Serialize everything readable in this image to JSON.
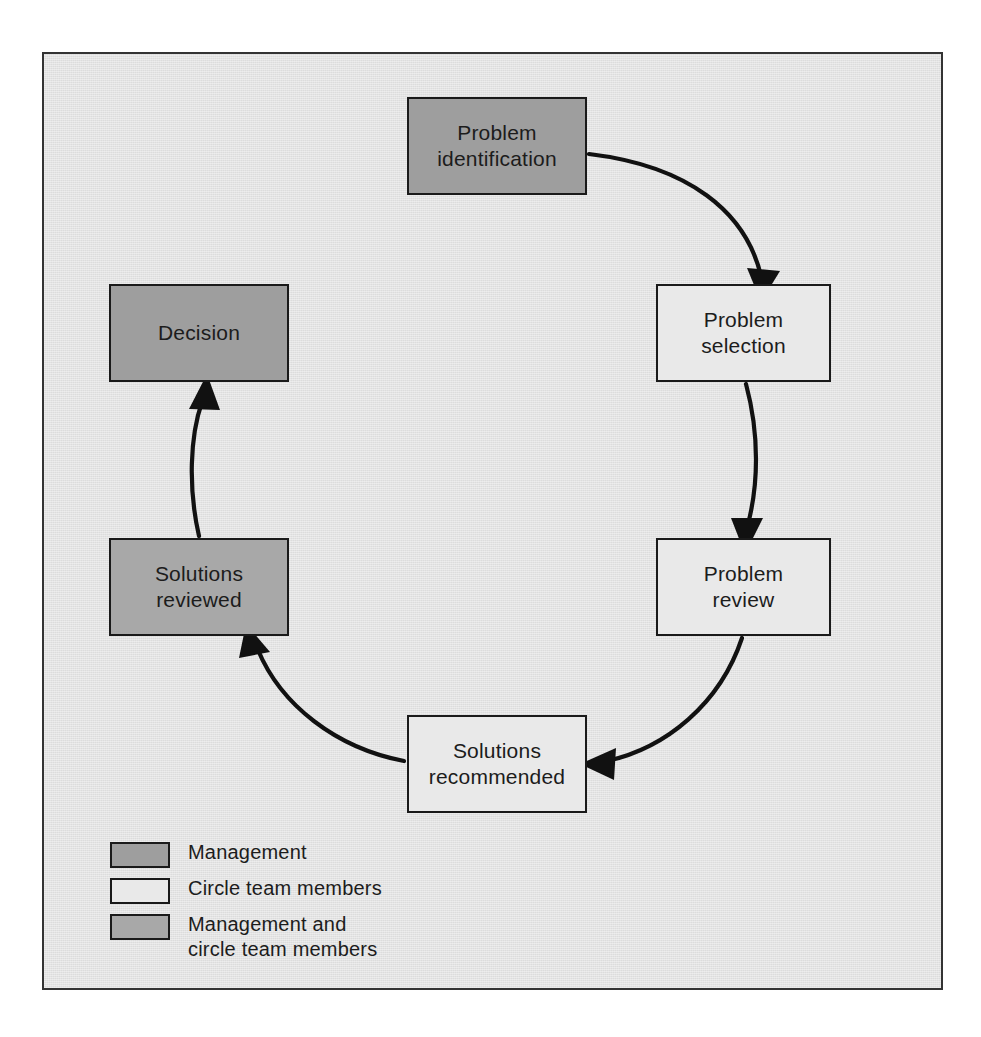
{
  "figure": {
    "frame_border_color": "#333333",
    "background_color": "#e3e3e3"
  },
  "palette": {
    "management": "#9e9e9e",
    "circle_team_members": "#e9e9e9",
    "management_and_circle_team_members": "#a8a8a8",
    "outline": "#1a1a1a",
    "arrow": "#111111",
    "text": "#1c1c1c"
  },
  "nodes": [
    {
      "id": "problem-identification",
      "label": "Problem\nidentification",
      "category": "management",
      "x": 363,
      "y": 43,
      "w": 180,
      "h": 98
    },
    {
      "id": "problem-selection",
      "label": "Problem\nselection",
      "category": "circle_team_members",
      "x": 612,
      "y": 230,
      "w": 175,
      "h": 98
    },
    {
      "id": "problem-review",
      "label": "Problem\nreview",
      "category": "circle_team_members",
      "x": 612,
      "y": 484,
      "w": 175,
      "h": 98
    },
    {
      "id": "solutions-recommended",
      "label": "Solutions\nrecommended",
      "category": "circle_team_members",
      "x": 363,
      "y": 661,
      "w": 180,
      "h": 98
    },
    {
      "id": "solutions-reviewed",
      "label": "Solutions\nreviewed",
      "category": "management_and_circle_team_members",
      "x": 65,
      "y": 484,
      "w": 180,
      "h": 98
    },
    {
      "id": "decision",
      "label": "Decision",
      "category": "management",
      "x": 65,
      "y": 230,
      "w": 180,
      "h": 98
    }
  ],
  "edges": [
    {
      "id": "edge-identification-to-selection",
      "from": "problem-identification",
      "to": "problem-selection",
      "path": "M 545 100 C 640 112 700 160 718 224",
      "arrow": "down"
    },
    {
      "id": "edge-selection-to-review",
      "from": "problem-selection",
      "to": "problem-review",
      "path": "M 703 330 C 716 380 716 430 706 478",
      "arrow": "down"
    },
    {
      "id": "edge-review-to-recommended",
      "from": "problem-review",
      "to": "solutions-recommended",
      "path": "M 700 584 C 676 648 620 694 551 708",
      "arrow": "left"
    },
    {
      "id": "edge-recommended-to-reviewed",
      "from": "solutions-recommended",
      "to": "solutions-reviewed",
      "path": "M 360 706 C 290 694 233 648 208 588",
      "arrow": "up-left"
    },
    {
      "id": "edge-reviewed-to-decision",
      "from": "solutions-reviewed",
      "to": "decision",
      "path": "M 156 480 C 146 432 146 380 157 336",
      "arrow": "up"
    }
  ],
  "legend": {
    "items": [
      {
        "id": "legend-management",
        "label": "Management",
        "category": "management"
      },
      {
        "id": "legend-circle-team-members",
        "label": "Circle team members",
        "category": "circle_team_members"
      },
      {
        "id": "legend-management-and-circle",
        "label": "Management and\ncircle team members",
        "category": "management_and_circle_team_members"
      }
    ]
  }
}
